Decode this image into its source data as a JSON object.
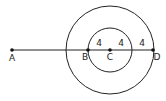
{
  "diagram": {
    "type": "geometry",
    "stroke_color": "#222222",
    "background": "#ffffff",
    "center": {
      "x": 110,
      "y": 50
    },
    "circles": [
      {
        "name": "inner-circle",
        "radius": 22
      },
      {
        "name": "outer-circle",
        "radius": 44
      }
    ],
    "segment": {
      "from": "A",
      "to": "D"
    },
    "points": [
      {
        "label": "A",
        "x": 12,
        "y": 50,
        "lx": 12,
        "ly": 61
      },
      {
        "label": "B",
        "x": 88,
        "y": 50,
        "lx": 85,
        "ly": 60
      },
      {
        "label": "C",
        "x": 110,
        "y": 50,
        "lx": 110,
        "ly": 60
      },
      {
        "label": "D",
        "x": 153,
        "y": 50,
        "lx": 157,
        "ly": 60
      }
    ],
    "measurements": [
      {
        "text": "4",
        "x": 99,
        "y": 46
      },
      {
        "text": "4",
        "x": 121,
        "y": 46
      },
      {
        "text": "4",
        "x": 142,
        "y": 46
      }
    ]
  }
}
